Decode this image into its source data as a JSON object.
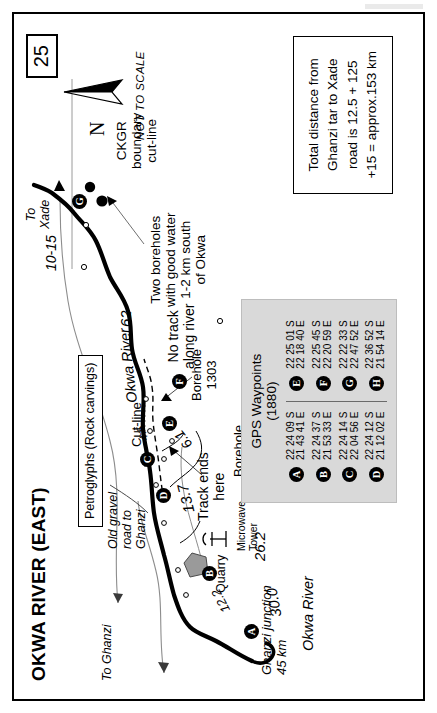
{
  "page": {
    "number": "25",
    "title": "OKWA RIVER (EAST)",
    "scale_note": "NOT TO SCALE",
    "north_label": "N"
  },
  "labels": {
    "river_name_left": "Okwa River",
    "river_name_mid": "Okwa River",
    "to_ghanzi": "To Ghanzi",
    "to_xade": "To\nXade",
    "ghanzi_junction": "Ghanzi junction\n45 km",
    "old_gravel_road": "Old gravel\nroad to\nGhanzi",
    "cut_line": "Cut-line",
    "quarry": "Quarry",
    "microwave_tower": "Microwave\nTower",
    "kang": "Kang\n153 km",
    "track_ends_here": "Track ends\nhere",
    "borehole_3359": "Borehole\n3359",
    "borehole_1303": "Borehole\n1303",
    "no_track_along_river": "No track\nalong river",
    "two_boreholes": "Two boreholes\nwith good water\n1-2 km south\nof Okwa",
    "ckgr_boundary": "CKGR\nboundary\ncut-line",
    "petroglyphs": "Petroglyphs\n(Rock carvings)"
  },
  "distances": {
    "d30_0": "30.0",
    "d12_2": "12.2",
    "d26_2": "26.2",
    "d13_7": "13.7",
    "d6_1": "6.1",
    "d4_5": "4.5",
    "d62": "62",
    "d10_15": "10-15"
  },
  "distance_note": {
    "line1": "Total distance from",
    "line2": "Ghanzi tar to Xade",
    "line3": "road is 12.5 + 125",
    "line4": "+15 = approx.153 km"
  },
  "gps": {
    "title_line1": "GPS Waypoints",
    "title_line2": "(1880)",
    "left": [
      {
        "id": "A",
        "lat": "22 24 09 S",
        "lon": "21 43 41 E"
      },
      {
        "id": "B",
        "lat": "22 24 37 S",
        "lon": "21 53 33 E"
      },
      {
        "id": "C",
        "lat": "22 24 14 S",
        "lon": "22 04 56 E"
      },
      {
        "id": "D",
        "lat": "22 24 12 S",
        "lon": "21 12 02 E"
      }
    ],
    "right": [
      {
        "id": "E",
        "lat": "22 25 01 S",
        "lon": "22 18 40 E"
      },
      {
        "id": "F",
        "lat": "22 25 45 S",
        "lon": "22 20 59 E"
      },
      {
        "id": "G",
        "lat": "22 22 33 S",
        "lon": "22 47 52 E"
      },
      {
        "id": "H",
        "lat": "22 36 52 S",
        "lon": "21 54 14 E"
      }
    ]
  },
  "map_waypoints": [
    {
      "id": "A"
    },
    {
      "id": "B"
    },
    {
      "id": "C"
    },
    {
      "id": "D"
    },
    {
      "id": "E"
    },
    {
      "id": "F"
    },
    {
      "id": "G"
    },
    {
      "id": "H"
    }
  ],
  "colors": {
    "ink": "#000000",
    "paper": "#ffffff",
    "table_fill": "#d9d9d9",
    "quarry_fill": "#9a9a9a",
    "faint_line": "#8d8d8d"
  }
}
